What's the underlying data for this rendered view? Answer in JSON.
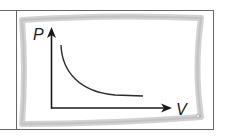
{
  "diagram": {
    "type": "pv-diagram",
    "title": "",
    "y_axis": {
      "label": "P"
    },
    "x_axis": {
      "label": "V"
    },
    "curve": {
      "shape": "hyperbola-decreasing",
      "description": "Pressure decreases as volume increases (P proportional to 1/V)"
    }
  },
  "colors": {
    "table_border": "#555555",
    "frame": "#c8c8c8",
    "axis": "#1a1a1a",
    "curve": "#2a2a2a",
    "background": "#ffffff"
  }
}
